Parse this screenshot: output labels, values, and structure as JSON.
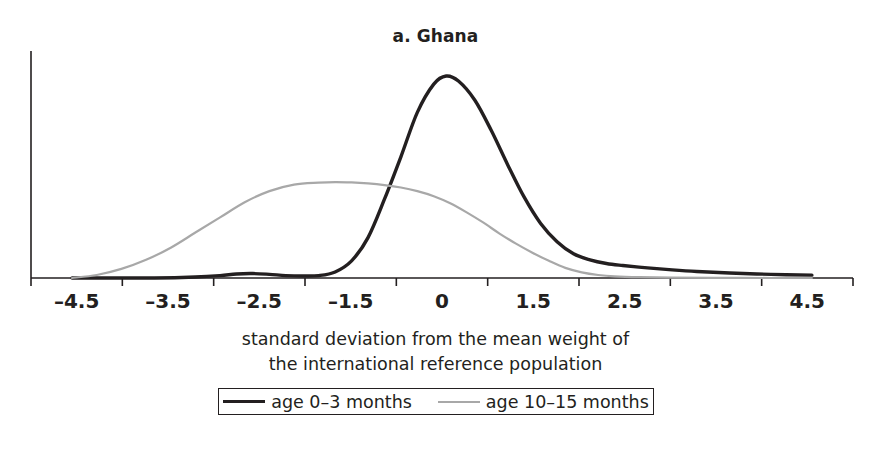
{
  "chart_data": {
    "type": "line",
    "title": "a. Ghana",
    "xlabel": "standard deviation from the mean weight of the international reference population",
    "xlabel_line1": "standard deviation from the mean weight of",
    "xlabel_line2": "the international reference population",
    "ylabel": "",
    "grid": false,
    "legend_position": "bottom",
    "xlim": [
      -5.0,
      5.0
    ],
    "ylim": [
      0,
      1.0
    ],
    "xticklabels": [
      "–4.5",
      "–3.5",
      "–2.5",
      "–1.5",
      "0",
      "1.5",
      "2.5",
      "3.5",
      "4.5"
    ],
    "xtickvalues": [
      -4.5,
      -3.5,
      -2.5,
      -1.5,
      0,
      1.5,
      2.5,
      3.5,
      4.5
    ],
    "axis_color": "#231f20",
    "series": [
      {
        "name": "age 0–3 months",
        "color": "#231f20",
        "width": 3.4,
        "x": [
          -4.5,
          -4.0,
          -3.5,
          -3.0,
          -2.7,
          -2.5,
          -2.3,
          -2.1,
          -1.9,
          -1.7,
          -1.5,
          -1.3,
          -1.1,
          -0.9,
          -0.7,
          -0.5,
          -0.3,
          -0.1,
          0.05,
          0.2,
          0.4,
          0.6,
          0.8,
          1.0,
          1.2,
          1.4,
          1.6,
          1.8,
          2.0,
          2.2,
          2.5,
          2.8,
          3.1,
          3.5,
          4.0,
          4.5
        ],
        "y": [
          0.0,
          0.0,
          0.0,
          0.005,
          0.012,
          0.02,
          0.022,
          0.018,
          0.012,
          0.01,
          0.012,
          0.03,
          0.085,
          0.2,
          0.39,
          0.6,
          0.82,
          0.96,
          1.0,
          0.975,
          0.88,
          0.73,
          0.56,
          0.4,
          0.27,
          0.18,
          0.12,
          0.09,
          0.072,
          0.062,
          0.05,
          0.04,
          0.032,
          0.025,
          0.018,
          0.014
        ]
      },
      {
        "name": "age 10–15 months",
        "color": "#a8a8a8",
        "width": 2.2,
        "x": [
          -4.5,
          -4.2,
          -3.9,
          -3.6,
          -3.3,
          -3.0,
          -2.7,
          -2.4,
          -2.1,
          -1.8,
          -1.5,
          -1.3,
          -1.1,
          -0.9,
          -0.7,
          -0.5,
          -0.3,
          -0.1,
          0.1,
          0.3,
          0.5,
          0.7,
          0.9,
          1.1,
          1.3,
          1.5,
          1.7,
          1.9,
          2.1,
          2.4,
          2.8,
          3.3,
          4.0,
          4.5
        ],
        "y": [
          0.0,
          0.015,
          0.045,
          0.09,
          0.15,
          0.225,
          0.3,
          0.375,
          0.43,
          0.462,
          0.472,
          0.475,
          0.473,
          0.468,
          0.46,
          0.448,
          0.43,
          0.405,
          0.37,
          0.325,
          0.275,
          0.22,
          0.17,
          0.125,
          0.085,
          0.05,
          0.028,
          0.015,
          0.008,
          0.004,
          0.002,
          0.001,
          0.0,
          0.0
        ]
      }
    ]
  },
  "legend": {
    "items": [
      {
        "label": "age 0–3 months",
        "style": "black-thick"
      },
      {
        "label": "age 10–15 months",
        "style": "gray-thin"
      }
    ]
  }
}
